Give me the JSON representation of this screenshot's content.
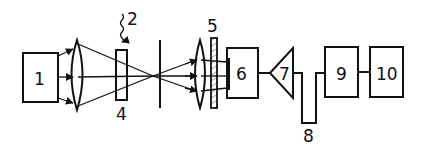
{
  "diagram": {
    "type": "optical-system-schematic",
    "colors": {
      "ink": "#111111",
      "background": "#ffffff"
    },
    "components": [
      {
        "id": "1",
        "label": "1",
        "shape": "box",
        "role": "light-source"
      },
      {
        "id": "lens-a",
        "label": "",
        "shape": "convex-lens"
      },
      {
        "id": "2",
        "label": "2",
        "shape": "wavy-arrow",
        "role": "external-signal"
      },
      {
        "id": "3",
        "label": "3",
        "shape": "rect-plate",
        "role": "sample-crystal"
      },
      {
        "id": "4",
        "label": "4",
        "shape": "aperture-line"
      },
      {
        "id": "lens-b",
        "label": "",
        "shape": "convex-lens"
      },
      {
        "id": "5",
        "label": "5",
        "shape": "hatched-plate",
        "role": "filter"
      },
      {
        "id": "6",
        "label": "6",
        "shape": "box",
        "role": "detector"
      },
      {
        "id": "7",
        "label": "7",
        "shape": "triangle",
        "role": "amplifier"
      },
      {
        "id": "8",
        "label": "8",
        "shape": "u-loop-connector"
      },
      {
        "id": "9",
        "label": "9",
        "shape": "box"
      },
      {
        "id": "10",
        "label": "10",
        "shape": "box"
      }
    ],
    "connections": [
      [
        "1",
        "lens-a"
      ],
      [
        "lens-a",
        "3"
      ],
      [
        "3",
        "4"
      ],
      [
        "4",
        "lens-b"
      ],
      [
        "lens-b",
        "5"
      ],
      [
        "5",
        "6"
      ],
      [
        "6",
        "7"
      ],
      [
        "7",
        "8"
      ],
      [
        "8",
        "9"
      ],
      [
        "9",
        "10"
      ]
    ]
  }
}
